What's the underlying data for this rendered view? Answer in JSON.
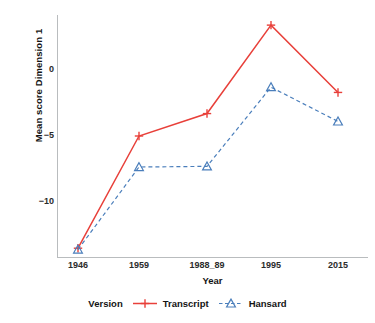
{
  "chart_data": {
    "type": "line",
    "title": "",
    "xlabel": "Year",
    "ylabel": "Mean score Dimension 1",
    "categories": [
      "1946",
      "1959",
      "1988_89",
      "1995",
      "2015"
    ],
    "yticks": [
      0,
      -5,
      -10
    ],
    "ytick_labels": [
      "0",
      "−5",
      "−10"
    ],
    "ylim": [
      -14.5,
      4.2
    ],
    "grid": false,
    "legend_position": "bottom",
    "legend_title": "Version",
    "series": [
      {
        "name": "Transcript",
        "values": [
          -13.5,
          -5.0,
          -3.3,
          3.4,
          -1.7
        ],
        "color": "#E8403A",
        "linestyle": "solid",
        "marker": "plus"
      },
      {
        "name": "Hansard",
        "values": [
          -13.6,
          -7.35,
          -7.3,
          -1.3,
          -3.9
        ],
        "color": "#4A7EBB",
        "linestyle": "dashed",
        "marker": "triangle"
      }
    ]
  }
}
